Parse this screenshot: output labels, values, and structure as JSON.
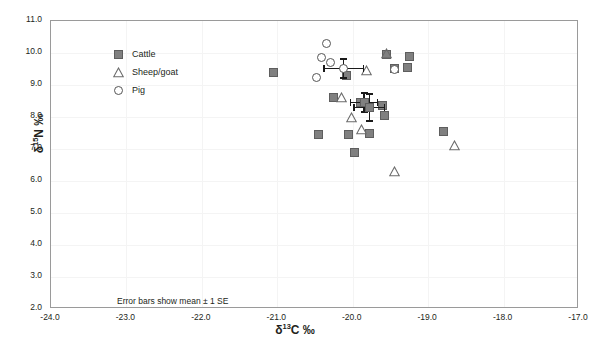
{
  "chart_data": {
    "type": "scatter",
    "title": "",
    "xlabel": "δ 13C ‰",
    "ylabel": "δ 15N ‰",
    "xlabel_parts": {
      "symbol": "δ",
      "sup": "13",
      "element": "C ‰"
    },
    "ylabel_parts": {
      "symbol": "δ",
      "sup": "15",
      "element": "N ‰"
    },
    "xlim": [
      -24.0,
      -17.0
    ],
    "ylim": [
      2.0,
      11.0
    ],
    "xticks": [
      "-24.0",
      "-23.0",
      "-22.0",
      "-21.0",
      "-20.0",
      "-19.0",
      "-18.0",
      "-17.0"
    ],
    "yticks": [
      "2.0",
      "3.0",
      "4.0",
      "5.0",
      "6.0",
      "7.0",
      "8.0",
      "9.0",
      "10.0",
      "11.0"
    ],
    "grid": true,
    "legend_position": "top-left",
    "annotation": "Error bars show mean ± 1 SE",
    "marker_color": "#808080",
    "marker_edge_color": "#5e5e5e",
    "errorbar_color": "#1a1a1a",
    "series": [
      {
        "name": "Cattle",
        "marker": "filled-square",
        "points": [
          [
            -21.05,
            9.4
          ],
          [
            -20.08,
            9.3
          ],
          [
            -20.25,
            8.6
          ],
          [
            -19.55,
            9.95
          ],
          [
            -19.45,
            9.52
          ],
          [
            -19.25,
            9.9
          ],
          [
            -19.28,
            9.55
          ],
          [
            -19.9,
            8.45
          ],
          [
            -19.6,
            8.35
          ],
          [
            -19.58,
            8.05
          ],
          [
            -20.45,
            7.45
          ],
          [
            -20.05,
            7.45
          ],
          [
            -19.78,
            7.5
          ],
          [
            -19.98,
            6.9
          ],
          [
            -18.8,
            7.55
          ]
        ],
        "mean": [
          -19.85,
          8.45
        ],
        "se_x": 0.18,
        "se_y": 0.3
      },
      {
        "name": "Sheep/goat",
        "marker": "open-triangle",
        "points": [
          [
            -20.15,
            8.62
          ],
          [
            -19.82,
            9.45
          ],
          [
            -19.55,
            9.98
          ],
          [
            -20.02,
            8.0
          ],
          [
            -19.88,
            7.6
          ],
          [
            -19.45,
            6.3
          ],
          [
            -18.65,
            7.1
          ]
        ],
        "mean": [
          -19.78,
          8.3
        ],
        "se_x": 0.2,
        "se_y": 0.42
      },
      {
        "name": "Pig",
        "marker": "open-circle",
        "points": [
          [
            -20.35,
            10.3
          ],
          [
            -20.42,
            9.85
          ],
          [
            -20.3,
            9.72
          ],
          [
            -20.48,
            9.25
          ],
          [
            -19.45,
            9.5
          ]
        ],
        "mean": [
          -20.12,
          9.52
        ],
        "se_x": 0.26,
        "se_y": 0.3
      }
    ]
  },
  "legend": {
    "items": [
      {
        "label": "Cattle",
        "marker": "filled-square"
      },
      {
        "label": "Sheep/goat",
        "marker": "open-triangle"
      },
      {
        "label": "Pig",
        "marker": "open-circle"
      }
    ]
  }
}
